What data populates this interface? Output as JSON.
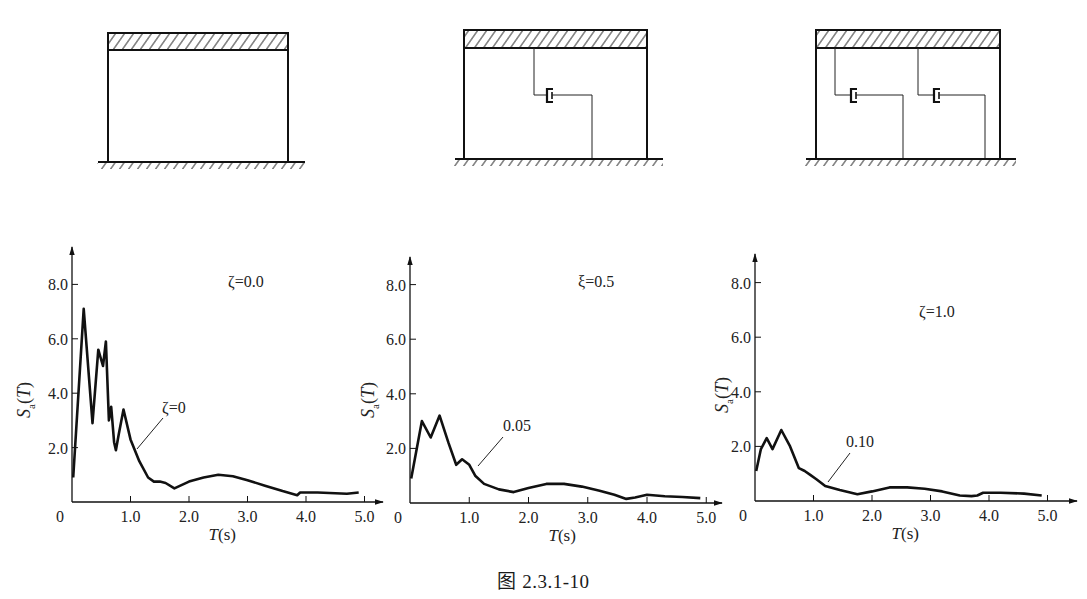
{
  "figure": {
    "caption": "图 2.3.1-10",
    "frames": [
      {
        "id": "frame-no-damper",
        "dampers": 0
      },
      {
        "id": "frame-one-damper",
        "dampers": 1
      },
      {
        "id": "frame-two-dampers",
        "dampers": 2
      }
    ]
  },
  "chart_data": [
    {
      "type": "line",
      "title": "ζ=0.0",
      "curve_label": "ζ=0",
      "xlabel": "T(s)",
      "ylabel": "Sa(T)",
      "xlim": [
        0,
        5.0
      ],
      "ylim": [
        0,
        8.0
      ],
      "x_ticks": [
        "0",
        "1.0",
        "2.0",
        "3.0",
        "4.0",
        "5.0"
      ],
      "y_ticks": [
        "2.0",
        "4.0",
        "6.0",
        "8.0"
      ],
      "grid": false,
      "x": [
        0.02,
        0.2,
        0.35,
        0.45,
        0.53,
        0.58,
        0.63,
        0.67,
        0.72,
        0.75,
        0.8,
        0.88,
        1.0,
        1.15,
        1.3,
        1.4,
        1.5,
        1.6,
        1.75,
        2.0,
        2.25,
        2.5,
        2.75,
        3.0,
        3.3,
        3.6,
        3.85,
        3.9,
        4.2,
        4.5,
        4.7,
        4.9
      ],
      "values": [
        0.9,
        7.1,
        2.9,
        5.6,
        5.0,
        5.9,
        3.0,
        3.5,
        2.2,
        1.9,
        2.5,
        3.4,
        2.3,
        1.5,
        0.9,
        0.75,
        0.75,
        0.7,
        0.5,
        0.75,
        0.9,
        1.0,
        0.95,
        0.8,
        0.6,
        0.4,
        0.25,
        0.35,
        0.35,
        0.32,
        0.3,
        0.35
      ]
    },
    {
      "type": "line",
      "title": "ξ=0.5",
      "curve_label": "0.05",
      "xlabel": "T(s)",
      "ylabel": "Sa(T)",
      "xlim": [
        0,
        5.0
      ],
      "ylim": [
        0,
        8.0
      ],
      "x_ticks": [
        "0",
        "1.0",
        "2.0",
        "3.0",
        "4.0",
        "5.0"
      ],
      "y_ticks": [
        "2.0",
        "4.0",
        "6.0",
        "8.0"
      ],
      "grid": false,
      "x": [
        0.02,
        0.2,
        0.35,
        0.5,
        0.65,
        0.78,
        0.88,
        1.0,
        1.1,
        1.25,
        1.5,
        1.75,
        2.0,
        2.3,
        2.6,
        2.9,
        3.2,
        3.45,
        3.65,
        3.8,
        4.0,
        4.3,
        4.6,
        4.9
      ],
      "values": [
        0.9,
        3.0,
        2.4,
        3.2,
        2.2,
        1.4,
        1.6,
        1.4,
        1.0,
        0.7,
        0.5,
        0.4,
        0.55,
        0.7,
        0.7,
        0.6,
        0.45,
        0.3,
        0.15,
        0.2,
        0.3,
        0.25,
        0.22,
        0.18
      ]
    },
    {
      "type": "line",
      "title": "ζ=1.0",
      "curve_label": "0.10",
      "xlabel": "T(s)",
      "ylabel": "Sa(T)",
      "xlim": [
        0,
        5.0
      ],
      "ylim": [
        0,
        8.0
      ],
      "x_ticks": [
        "0",
        "1.0",
        "2.0",
        "3.0",
        "4.0",
        "5.0"
      ],
      "y_ticks": [
        "2.0",
        "4.0",
        "6.0",
        "8.0"
      ],
      "grid": false,
      "x": [
        0.02,
        0.1,
        0.2,
        0.3,
        0.45,
        0.6,
        0.75,
        0.85,
        0.95,
        1.05,
        1.2,
        1.45,
        1.75,
        2.0,
        2.3,
        2.6,
        2.9,
        3.2,
        3.5,
        3.7,
        3.8,
        3.9,
        4.2,
        4.6,
        4.9
      ],
      "values": [
        1.1,
        1.9,
        2.3,
        1.9,
        2.6,
        2.0,
        1.2,
        1.1,
        0.95,
        0.8,
        0.55,
        0.4,
        0.25,
        0.35,
        0.5,
        0.5,
        0.45,
        0.35,
        0.2,
        0.18,
        0.2,
        0.3,
        0.3,
        0.27,
        0.2
      ]
    }
  ]
}
